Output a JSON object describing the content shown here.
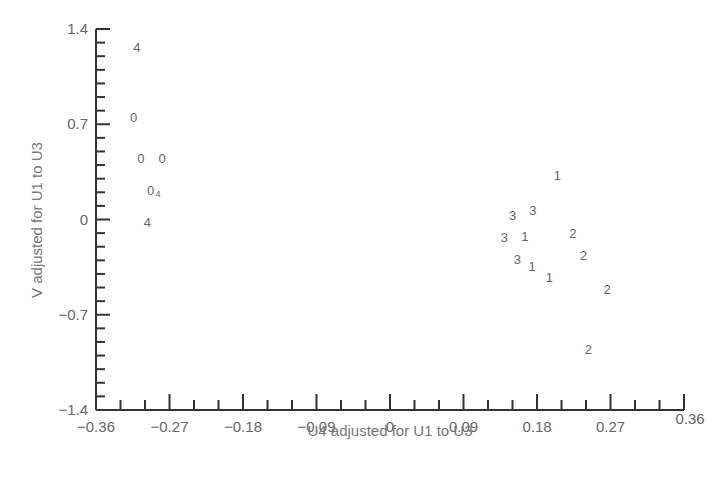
{
  "chart_data": {
    "type": "scatter",
    "title": "",
    "xlabel": "U4 adjusted for U1 to U3",
    "ylabel": "V adjusted for U1 to U3",
    "xlim": [
      -0.36,
      0.36
    ],
    "ylim": [
      -1.4,
      1.4
    ],
    "xticks": [
      -0.36,
      -0.27,
      -0.18,
      -0.09,
      0,
      0.09,
      0.18,
      0.27,
      0.36
    ],
    "xtick_labels": [
      "−0.36",
      "−0.27",
      "−0.18",
      "−0.09",
      "0",
      "0.09",
      "0.18",
      "0.27",
      "0.36"
    ],
    "yticks": [
      1.4,
      0.7,
      0,
      -0.7,
      -1.4
    ],
    "ytick_labels": [
      "1.4",
      "0.7",
      "0",
      "−0.7",
      "−1.4"
    ],
    "x_minor_per_major": 3,
    "y_minor_per_major": 7,
    "grid": false,
    "legend": null,
    "marker_style": "plotted as text labels (group codes 0-4)",
    "points": [
      {
        "label": "4",
        "x": -0.31,
        "y": 1.27
      },
      {
        "label": "0",
        "x": -0.314,
        "y": 0.75
      },
      {
        "label": "0",
        "x": -0.305,
        "y": 0.45
      },
      {
        "label": "0",
        "x": -0.279,
        "y": 0.45
      },
      {
        "label": "0",
        "x": -0.293,
        "y": 0.22
      },
      {
        "label": "4",
        "x": -0.284,
        "y": 0.2,
        "small": true
      },
      {
        "label": "4",
        "x": -0.297,
        "y": -0.02
      },
      {
        "label": "1",
        "x": 0.205,
        "y": 0.33
      },
      {
        "label": "3",
        "x": 0.15,
        "y": 0.03
      },
      {
        "label": "3",
        "x": 0.175,
        "y": 0.07
      },
      {
        "label": "3",
        "x": 0.14,
        "y": -0.13
      },
      {
        "label": "1",
        "x": 0.165,
        "y": -0.12
      },
      {
        "label": "2",
        "x": 0.224,
        "y": -0.1
      },
      {
        "label": "3",
        "x": 0.156,
        "y": -0.29
      },
      {
        "label": "1",
        "x": 0.174,
        "y": -0.34
      },
      {
        "label": "2",
        "x": 0.237,
        "y": -0.26
      },
      {
        "label": "1",
        "x": 0.195,
        "y": -0.42
      },
      {
        "label": "2",
        "x": 0.266,
        "y": -0.51
      },
      {
        "label": "2",
        "x": 0.243,
        "y": -0.95
      }
    ],
    "colors": {
      "axis": "#333333",
      "text": "#666666"
    }
  }
}
